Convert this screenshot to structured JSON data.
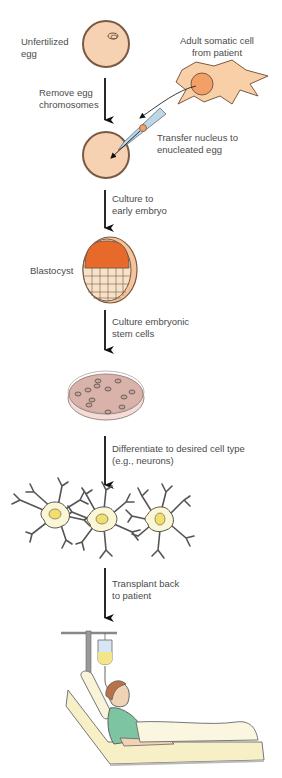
{
  "colors": {
    "egg_fill": "#f7d2b2",
    "egg_stroke": "#7a5a44",
    "somatic_cell_fill": "#f9cfa8",
    "nucleus_fill": "#f2a068",
    "blastocyst_inner": "#e86a2a",
    "dish_medium": "#d9b3aa",
    "neuron_body": "#fbf6d4",
    "neuron_nucleus": "#f1df6a",
    "gown": "#7cc4a2",
    "bed": "#f7efc6",
    "arrow": "#111111"
  },
  "labels": {
    "unfertilized_egg": [
      "Unfertilized",
      "egg"
    ],
    "adult_somatic_cell": [
      "Adult somatic cell",
      "from patient"
    ],
    "remove_chromosomes": [
      "Remove egg",
      "chromosomes"
    ],
    "transfer_nucleus": [
      "Transfer nucleus to",
      "enucleated egg"
    ],
    "culture_embryo": [
      "Culture to",
      "early embryo"
    ],
    "blastocyst": [
      "Blastocyst"
    ],
    "culture_stem_cells": [
      "Culture embryonic",
      "stem cells"
    ],
    "differentiate": [
      "Differentiate to desired cell type",
      "(e.g., neurons)"
    ],
    "transplant": [
      "Transplant back",
      "to patient"
    ]
  },
  "steps": [
    "Unfertilized egg",
    "Remove egg chromosomes",
    "Transfer nucleus to enucleated egg",
    "Culture to early embryo",
    "Blastocyst",
    "Culture embryonic stem cells",
    "Differentiate to desired cell type (e.g., neurons)",
    "Transplant back to patient"
  ]
}
